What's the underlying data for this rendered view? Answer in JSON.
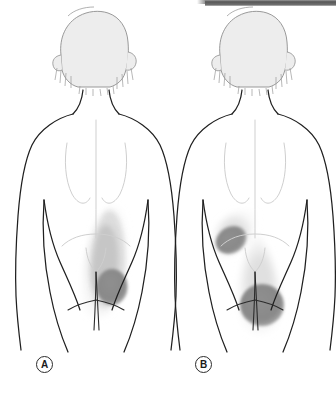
{
  "figure": {
    "panels": [
      {
        "id": "A",
        "label": "A",
        "caption_letter": "A",
        "view": "posterior",
        "pain_regions": [
          {
            "name": "upper-lateral-gluteal-spill",
            "intensity": "light",
            "color": "#e0e0e0"
          },
          {
            "name": "mid-gluteal-band",
            "intensity": "medium",
            "color": "#c4c4c4"
          },
          {
            "name": "primary-trigger-point",
            "intensity": "dark",
            "color": "#8b8b8b"
          }
        ]
      },
      {
        "id": "B",
        "label": "B",
        "caption_letter": "B",
        "view": "posterior",
        "pain_regions": [
          {
            "name": "upper-outer-gluteal-oval",
            "intensity": "dark",
            "color": "#8b8b8b"
          },
          {
            "name": "upper-outer-gluteal-halo",
            "intensity": "light",
            "color": "#e2e2e2"
          },
          {
            "name": "lower-medial-gluteal-teardrop",
            "intensity": "dark",
            "color": "#8b8b8b"
          },
          {
            "name": "lower-medial-gluteal-halo",
            "intensity": "light",
            "color": "#e2e2e2"
          }
        ]
      }
    ],
    "colors": {
      "outline": "#1f1f1f",
      "soft_outline": "#b9b9b9",
      "hair_fill": "#ededed",
      "hair_stroke": "#8f8f8f",
      "pain_light": "#e2e2e2",
      "pain_medium": "#c4c4c4",
      "pain_dark": "#8b8b8b",
      "background": "#ffffff",
      "scan_bar": "#575757"
    }
  }
}
